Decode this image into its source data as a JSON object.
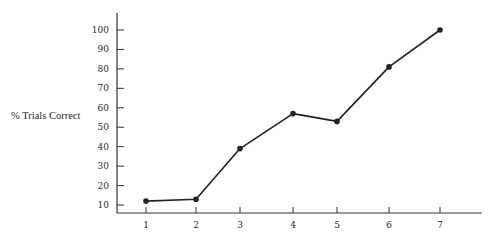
{
  "chart_data": {
    "type": "line",
    "title": "",
    "xlabel": "",
    "ylabel": "% Trials Correct",
    "x": [
      1,
      2,
      3,
      4,
      5,
      6,
      7
    ],
    "categories": [
      "1",
      "2",
      "3",
      "4",
      "5",
      "6",
      "7"
    ],
    "series": [
      {
        "name": "% Trials Correct",
        "values": [
          12,
          13,
          39,
          57,
          53,
          81,
          100
        ]
      }
    ],
    "yticks": [
      10,
      20,
      30,
      40,
      50,
      60,
      70,
      80,
      90,
      100
    ],
    "ylim": [
      5,
      105
    ],
    "xlim": [
      0.5,
      7.8
    ],
    "grid": false,
    "legend": null,
    "markers": true,
    "line_color": "#222222"
  },
  "layout": {
    "y_axis_x": 117,
    "x_axis_y": 213,
    "y_axis_top": 13,
    "x_axis_right": 482,
    "x_positions": [
      146,
      196,
      240,
      293,
      337,
      389,
      440
    ],
    "y_value_10_px": 205,
    "y_value_100_px": 30
  }
}
